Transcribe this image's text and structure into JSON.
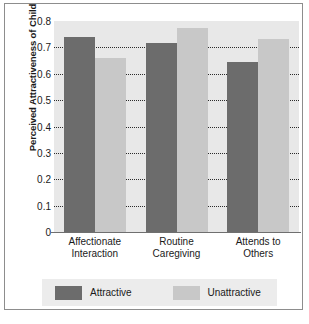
{
  "chart_data": {
    "type": "bar",
    "title": "",
    "xlabel": "",
    "ylabel": "Perceived Attractiveness of Child",
    "ylim": [
      0,
      0.8
    ],
    "yticks": [
      "0.8",
      "0.7",
      "0.6",
      "0.5",
      "0.4",
      "0.3",
      "0.2",
      "0.1",
      "0"
    ],
    "ytick_values": [
      0.8,
      0.7,
      0.6,
      0.5,
      0.4,
      0.3,
      0.2,
      0.1,
      0
    ],
    "grid": true,
    "gridlines_at": [
      0.7,
      0.6,
      0.5,
      0.4,
      0.3,
      0.2,
      0.1
    ],
    "legend_position": "bottom",
    "categories": [
      "Affectionate Interaction",
      "Routine Caregiving",
      "Attends to Others"
    ],
    "category_lines": [
      [
        "Affectionate",
        "Interaction"
      ],
      [
        "Routine",
        "Caregiving"
      ],
      [
        "Attends to",
        "Others"
      ]
    ],
    "series": [
      {
        "name": "Attractive",
        "color": "#6c6c6c",
        "values": [
          0.74,
          0.715,
          0.645
        ]
      },
      {
        "name": "Unattractive",
        "color": "#c8c8c8",
        "values": [
          0.66,
          0.775,
          0.73
        ]
      }
    ]
  },
  "legend": {
    "entries": [
      {
        "label": "Attractive"
      },
      {
        "label": "Unattractive"
      }
    ]
  },
  "colors": {
    "attractive": "#6c6c6c",
    "unattractive": "#c8c8c8",
    "plot_background": "#e8e8e8",
    "legend_background": "#ececec",
    "frame_border": "#8d8d8d",
    "text": "#1a1a1a"
  }
}
